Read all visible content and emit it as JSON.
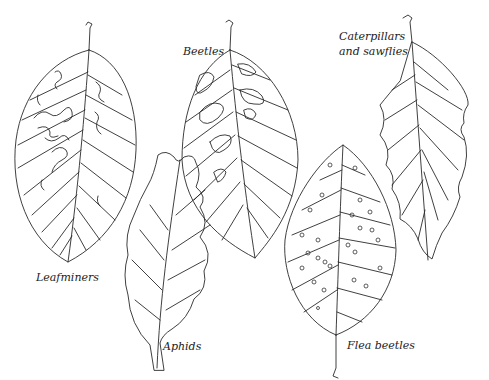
{
  "figure": {
    "labels": {
      "leafminers": "Leafminers",
      "beetles": "Beetles",
      "caterpillars_line1": "Caterpillars",
      "caterpillars_line2": "and sawflies",
      "aphids": "Aphids",
      "flea_beetles": "Flea beetles"
    },
    "leaves": [
      {
        "id": "leafminers",
        "damage": "serpentine mines"
      },
      {
        "id": "beetles",
        "damage": "skeletonized blotches between veins"
      },
      {
        "id": "caterpillars",
        "damage": "ragged chewed margins"
      },
      {
        "id": "aphids",
        "damage": "curled, distorted leaf"
      },
      {
        "id": "flea-beetles",
        "damage": "small round shot holes"
      }
    ],
    "colors": {
      "line": "#2a2a2a",
      "background": "#ffffff"
    }
  }
}
